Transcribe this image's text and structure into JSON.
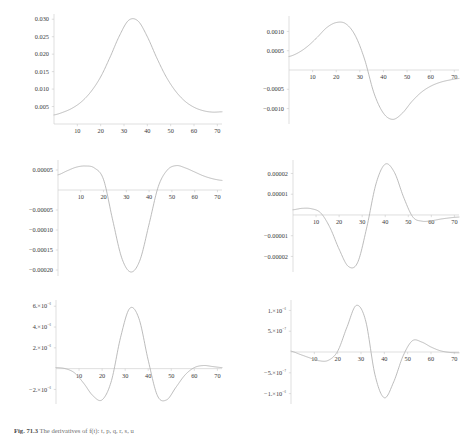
{
  "figure": {
    "caption_label": "Fig. 71.3",
    "caption_text": "The derivatives of f(t): t, p, q, r, s, u"
  },
  "chart_data": [
    {
      "type": "line",
      "panel": 1,
      "title": "f(t)",
      "xlabel": "",
      "ylabel": "",
      "xlim": [
        0,
        72
      ],
      "ylim": [
        0,
        0.0315
      ],
      "xticks": [
        10,
        20,
        30,
        40,
        50,
        60,
        70
      ],
      "yticks": [
        0.005,
        0.01,
        0.015,
        0.02,
        0.025,
        0.03
      ],
      "ytick_labels": [
        "0.005",
        "0.010",
        "0.015",
        "0.020",
        "0.025",
        "0.030"
      ],
      "grid": false,
      "legend": "none",
      "curve": "gaussian-like peak",
      "peak_x": 33,
      "peak_y": 0.03,
      "value_at_0": 0.0026,
      "value_at_72": 0.0035,
      "x": [
        0,
        4,
        8,
        12,
        16,
        20,
        24,
        28,
        32,
        36,
        40,
        44,
        48,
        52,
        56,
        60,
        64,
        68,
        72
      ],
      "values": [
        0.0026,
        0.0034,
        0.0046,
        0.0065,
        0.0094,
        0.0135,
        0.0191,
        0.0252,
        0.0297,
        0.0295,
        0.025,
        0.019,
        0.0136,
        0.0095,
        0.0066,
        0.0048,
        0.0038,
        0.0034,
        0.0035
      ]
    },
    {
      "type": "line",
      "panel": 2,
      "title": "f'(t)",
      "xlabel": "",
      "ylabel": "",
      "xlim": [
        0,
        72
      ],
      "ylim": [
        -0.0014,
        0.0014
      ],
      "xticks": [
        10,
        20,
        30,
        40,
        50,
        60,
        70
      ],
      "yticks": [
        -0.001,
        -0.0005,
        0.0005,
        0.001
      ],
      "ytick_labels": [
        "-0.0010",
        "-0.0005",
        "0.0005",
        "0.0010"
      ],
      "grid": false,
      "legend": "none",
      "curve": "first derivative",
      "peak_x": 22,
      "peak_y": 0.00125,
      "trough_x": 43,
      "trough_y": -0.00128,
      "zero_crossing_x": 33,
      "x": [
        0,
        4,
        8,
        12,
        16,
        20,
        24,
        28,
        32,
        36,
        40,
        44,
        48,
        52,
        56,
        60,
        64,
        68,
        72
      ],
      "values": [
        0.00035,
        0.00045,
        0.00062,
        0.00085,
        0.0011,
        0.00123,
        0.0012,
        0.0009,
        0.00028,
        -0.0006,
        -0.00112,
        -0.00128,
        -0.00112,
        -0.00082,
        -0.00058,
        -0.00042,
        -0.00032,
        -0.00026,
        -0.00022
      ]
    },
    {
      "type": "line",
      "panel": 3,
      "title": "f''(t)",
      "xlabel": "",
      "ylabel": "",
      "xlim": [
        0,
        72
      ],
      "ylim": [
        -0.000215,
        7.5e-05
      ],
      "xticks": [
        10,
        20,
        30,
        40,
        50,
        60,
        70
      ],
      "yticks": [
        -0.0002,
        -0.00015,
        -0.0001,
        -5e-05,
        5e-05
      ],
      "ytick_labels": [
        "-0.00020",
        "-0.00015",
        "-0.00010",
        "-0.00005",
        "0.00005"
      ],
      "grid": false,
      "legend": "none",
      "curve": "second derivative",
      "peak_x": 14,
      "peak_y": 6e-05,
      "trough_x": 33,
      "trough_y": -0.000205,
      "second_peak_x": 52,
      "second_peak_y": 6e-05,
      "x": [
        0,
        4,
        8,
        12,
        16,
        20,
        24,
        28,
        32,
        36,
        40,
        44,
        48,
        52,
        56,
        60,
        64,
        68,
        72
      ],
      "values": [
        3.8e-05,
        4.8e-05,
        5.7e-05,
        6e-05,
        5.5e-05,
        2.6e-05,
        -7.5e-05,
        -0.00017,
        -0.000205,
        -0.000175,
        -8.5e-05,
        8e-06,
        5e-05,
        6.1e-05,
        5.5e-05,
        4.5e-05,
        3.5e-05,
        2.8e-05,
        2.4e-05
      ]
    },
    {
      "type": "line",
      "panel": 4,
      "title": "f'''(t)",
      "xlabel": "",
      "ylabel": "",
      "xlim": [
        0,
        72
      ],
      "ylim": [
        -2.75e-05,
        2.65e-05
      ],
      "xticks": [
        10,
        20,
        30,
        40,
        50,
        60,
        70
      ],
      "yticks": [
        -2e-05,
        -1e-05,
        1e-05,
        2e-05
      ],
      "ytick_labels": [
        "-0.00002",
        "-0.00001",
        "0.00001",
        "0.00002"
      ],
      "grid": false,
      "legend": "none",
      "curve": "third derivative",
      "trough_x": 25,
      "trough_y": -2.55e-05,
      "peak_x": 40,
      "peak_y": 2.45e-05,
      "x": [
        0,
        4,
        8,
        12,
        16,
        20,
        24,
        28,
        32,
        36,
        40,
        44,
        48,
        52,
        56,
        60,
        64,
        68,
        72
      ],
      "values": [
        2.5e-06,
        3.2e-06,
        3e-06,
        1e-06,
        -6e-06,
        -1.65e-05,
        -2.48e-05,
        -2.3e-05,
        -6e-06,
        1.5e-05,
        2.45e-05,
        2.05e-05,
        8.5e-06,
        -1e-06,
        -3e-06,
        -2.8e-06,
        -2e-06,
        -1.4e-06,
        -1e-06
      ]
    },
    {
      "type": "line",
      "panel": 5,
      "title": "f''''(t)",
      "xlabel": "",
      "ylabel": "",
      "xlim": [
        0,
        72
      ],
      "ylim": [
        -3.4e-06,
        6.6e-06
      ],
      "xticks": [
        10,
        20,
        30,
        40,
        50,
        60,
        70
      ],
      "yticks": [
        -2e-06,
        2e-06,
        4e-06,
        6e-06
      ],
      "ytick_labels": [
        "-2.×10⁻⁶",
        "2.×10⁻⁶",
        "4.×10⁻⁶",
        "6.×10⁻⁶"
      ],
      "grid": false,
      "legend": "none",
      "curve": "fourth derivative",
      "trough1_x": 20,
      "trough1_y": -3e-06,
      "peak_x": 33,
      "peak_y": 6e-06,
      "trough2_x": 45,
      "trough2_y": -3e-06,
      "x": [
        0,
        4,
        8,
        12,
        16,
        20,
        24,
        28,
        32,
        36,
        40,
        44,
        48,
        52,
        56,
        60,
        64,
        68,
        72
      ],
      "values": [
        1e-07,
        0.0,
        -4e-07,
        -1.4e-06,
        -2.6e-06,
        -3e-06,
        -1.2e-06,
        3e-06,
        5.8e-06,
        4.8e-06,
        8e-07,
        -2.6e-06,
        -3e-06,
        -1.8e-06,
        -6e-07,
        1e-07,
        3e-07,
        2e-07,
        1e-07
      ]
    },
    {
      "type": "line",
      "panel": 6,
      "title": "f'''''(t)",
      "xlabel": "",
      "ylabel": "",
      "xlim": [
        0,
        72
      ],
      "ylim": [
        -1.25e-06,
        1.25e-06
      ],
      "xticks": [
        10,
        20,
        30,
        40,
        50,
        60,
        70
      ],
      "yticks": [
        -1e-06,
        -5e-07,
        5e-07,
        1e-06
      ],
      "ytick_labels": [
        "-1.×10⁻⁶",
        "-5.×10⁻⁷",
        "5.×10⁻⁷",
        "1.×10⁻⁶"
      ],
      "grid": false,
      "legend": "none",
      "curve": "fifth derivative",
      "trough1_x": 15,
      "trough1_y": -2.2e-07,
      "peak_x": 28,
      "peak_y": 1.12e-06,
      "trough2_x": 38,
      "trough2_y": -1.12e-06,
      "peak2_x": 50,
      "peak2_y": 2.8e-07,
      "x": [
        0,
        4,
        8,
        12,
        16,
        20,
        24,
        28,
        32,
        36,
        40,
        44,
        48,
        52,
        56,
        60,
        64,
        68,
        72
      ],
      "values": [
        2e-08,
        -6e-08,
        -1.4e-07,
        -2.1e-07,
        -2e-07,
        2e-08,
        6e-07,
        1.12e-06,
        7.5e-07,
        -5.5e-07,
        -1.1e-06,
        -7.2e-07,
        -1e-07,
        2.7e-07,
        2.4e-07,
        1.2e-07,
        3e-08,
        -1e-08,
        -2e-08
      ]
    }
  ]
}
